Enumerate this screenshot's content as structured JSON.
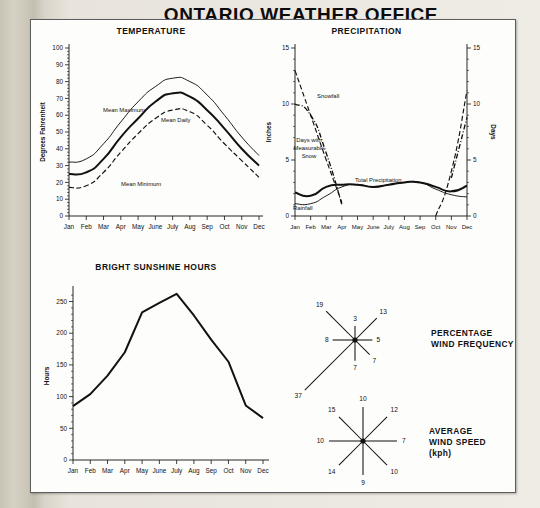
{
  "document": {
    "title": "ONTARIO WEATHER OFFICE",
    "background_color": "#cfcabd",
    "sheet_color": "#fdfdfc"
  },
  "months": [
    "Jan",
    "Feb",
    "Mar",
    "Apr",
    "May",
    "June",
    "July",
    "Aug",
    "Sep",
    "Oct",
    "Nov",
    "Dec"
  ],
  "panels": {
    "temperature": {
      "title": "TEMPERATURE",
      "ylabel": "Degrees Fahrenheit",
      "yticks": [
        "100",
        "90",
        "80",
        "70",
        "60",
        "50",
        "40",
        "30",
        "20",
        "10",
        "0"
      ],
      "series_labels": {
        "max": "Mean Maximum",
        "daily": "Mean Daily",
        "min": "Mean Minimum"
      }
    },
    "precipitation": {
      "title": "PRECIPITATION",
      "ylabel_left": "Inches",
      "ylabel_right": "Days",
      "yticks_left": [
        "15",
        "10",
        "5",
        "0"
      ],
      "yticks_right": [
        "15",
        "10",
        "5",
        "0"
      ],
      "series_labels": {
        "snowfall": "Snowfall",
        "days_snow": "Days with\nMeasurable\nSnow",
        "total": "Total Precipitation",
        "rainfall": "Rainfall"
      }
    },
    "sunshine": {
      "title": "BRIGHT SUNSHINE HOURS",
      "ylabel": "Hours",
      "yticks": [
        "250",
        "200",
        "150",
        "100",
        "50",
        "0"
      ]
    },
    "wind_frequency": {
      "caption_line1": "PERCENTAGE",
      "caption_line2": "WIND FREQUENCY"
    },
    "wind_speed": {
      "caption_line1": "AVERAGE",
      "caption_line2": "WIND SPEED",
      "caption_line3": "(kph)"
    }
  },
  "chart_data": [
    {
      "type": "line",
      "title": "TEMPERATURE",
      "xlabel": "",
      "ylabel": "Degrees Fahrenheit",
      "categories": [
        "Jan",
        "Feb",
        "Mar",
        "Apr",
        "May",
        "June",
        "July",
        "Aug",
        "Sep",
        "Oct",
        "Nov",
        "Dec"
      ],
      "ylim": [
        0,
        100
      ],
      "yticks": [
        0,
        10,
        20,
        30,
        40,
        50,
        60,
        70,
        80,
        90,
        100
      ],
      "grid": false,
      "legend": "inline-annotations",
      "series": [
        {
          "name": "Mean Maximum",
          "style": "solid-thin",
          "values": [
            32,
            34,
            43,
            56,
            68,
            77,
            82,
            80,
            72,
            60,
            47,
            36
          ]
        },
        {
          "name": "Mean Daily",
          "style": "solid-thick",
          "values": [
            25,
            26,
            34,
            47,
            58,
            68,
            73,
            71,
            63,
            52,
            40,
            30
          ]
        },
        {
          "name": "Mean Minimum",
          "style": "dashed",
          "values": [
            17,
            18,
            26,
            38,
            49,
            58,
            63,
            62,
            54,
            43,
            33,
            23
          ]
        }
      ]
    },
    {
      "type": "line",
      "title": "PRECIPITATION",
      "xlabel": "",
      "ylabel": "Inches",
      "ylabel_secondary": "Days",
      "categories": [
        "Jan",
        "Feb",
        "Mar",
        "Apr",
        "May",
        "June",
        "July",
        "Aug",
        "Sep",
        "Oct",
        "Nov",
        "Dec"
      ],
      "ylim": [
        0,
        15
      ],
      "yticks": [
        0,
        5,
        10,
        15
      ],
      "ylim_secondary": [
        0,
        15
      ],
      "yticks_secondary": [
        0,
        5,
        10,
        15
      ],
      "grid": false,
      "legend": "inline-annotations",
      "series": [
        {
          "name": "Snowfall",
          "axis": "left",
          "style": "dashed",
          "values": [
            13.0,
            9.0,
            5.0,
            1.2,
            null,
            null,
            null,
            null,
            null,
            0.0,
            4.0,
            11.2
          ]
        },
        {
          "name": "Days with Measurable Snow",
          "axis": "right",
          "style": "dash-dot",
          "values": [
            10.0,
            9.0,
            5.6,
            1.0,
            null,
            null,
            null,
            null,
            null,
            null,
            3.4,
            8.8
          ]
        },
        {
          "name": "Total Precipitation",
          "axis": "left",
          "style": "solid-thick",
          "values": [
            2.1,
            1.8,
            2.6,
            2.8,
            2.8,
            2.6,
            2.8,
            3.0,
            3.0,
            2.6,
            2.2,
            2.7
          ]
        },
        {
          "name": "Rainfall",
          "axis": "left",
          "style": "solid-thin",
          "values": [
            1.1,
            1.1,
            1.8,
            2.6,
            2.8,
            2.6,
            2.8,
            3.0,
            3.0,
            2.4,
            1.9,
            1.7
          ]
        }
      ]
    },
    {
      "type": "line",
      "title": "BRIGHT SUNSHINE HOURS",
      "xlabel": "",
      "ylabel": "Hours",
      "categories": [
        "Jan",
        "Feb",
        "Mar",
        "Apr",
        "May",
        "June",
        "July",
        "Aug",
        "Sep",
        "Oct",
        "Nov",
        "Dec"
      ],
      "ylim": [
        0,
        265
      ],
      "yticks": [
        0,
        50,
        100,
        150,
        200,
        250
      ],
      "grid": false,
      "series": [
        {
          "name": "Bright Sunshine Hours",
          "style": "solid-thick",
          "values": [
            85,
            104,
            133,
            170,
            233,
            248,
            262,
            228,
            190,
            155,
            86,
            66
          ]
        }
      ]
    },
    {
      "type": "wind-rose",
      "title": "PERCENTAGE WIND FREQUENCY",
      "units": "%",
      "directions": [
        "N",
        "NE",
        "E",
        "SE",
        "S",
        "SW",
        "W",
        "NW"
      ],
      "values": [
        3,
        13,
        5,
        7,
        7,
        37,
        8,
        19
      ]
    },
    {
      "type": "wind-rose",
      "title": "AVERAGE WIND SPEED (kph)",
      "units": "kph",
      "directions": [
        "N",
        "NE",
        "E",
        "SE",
        "S",
        "SW",
        "W",
        "NW"
      ],
      "values": [
        10,
        12,
        7,
        10,
        9,
        14,
        10,
        15
      ]
    }
  ]
}
